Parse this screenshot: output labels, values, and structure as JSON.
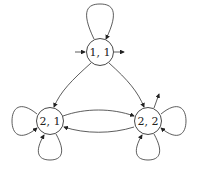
{
  "diagram": {
    "type": "state-transition-graph",
    "nodes": [
      {
        "id": "n11",
        "label": "1, 1",
        "x": 100,
        "y": 52
      },
      {
        "id": "n21",
        "label": "2, 1",
        "x": 50,
        "y": 121
      },
      {
        "id": "n22",
        "label": "2, 2",
        "x": 148,
        "y": 121
      }
    ],
    "edges": [
      {
        "from": "n11",
        "to": "n11",
        "kind": "self-loop-top"
      },
      {
        "from": "n11",
        "to": "n21",
        "kind": "arc"
      },
      {
        "from": "n11",
        "to": "n22",
        "kind": "arc"
      },
      {
        "from": "n21",
        "to": "n22",
        "kind": "arc-upper"
      },
      {
        "from": "n22",
        "to": "n21",
        "kind": "arc-lower"
      },
      {
        "from": "n21",
        "to": "n21",
        "kind": "self-loop-left"
      },
      {
        "from": "n21",
        "to": "n21",
        "kind": "self-loop-bottom"
      },
      {
        "from": "n22",
        "to": "n22",
        "kind": "self-loop-right"
      },
      {
        "from": "n22",
        "to": "n22",
        "kind": "self-loop-bottom"
      }
    ],
    "initial": "n11",
    "final": [
      "n11",
      "n22"
    ]
  }
}
